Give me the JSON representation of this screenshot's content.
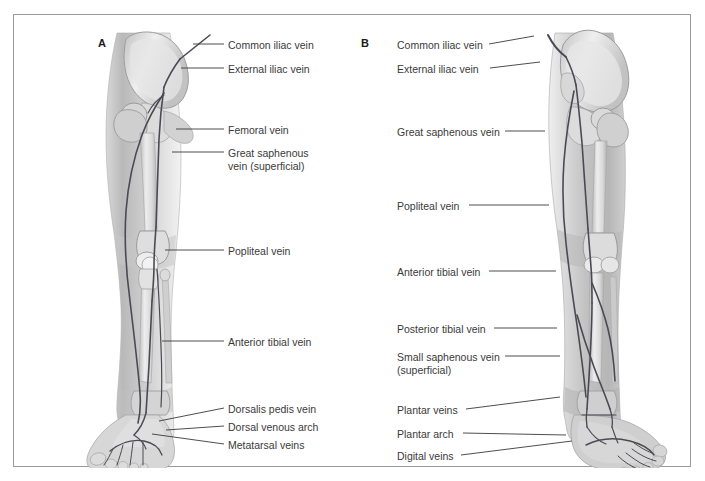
{
  "figure": {
    "background_color": "#ffffff",
    "frame_color": "#9a9a9a",
    "text_color": "#3a3a3a",
    "vein_color": "#4a4a52",
    "panels": [
      {
        "letter": "A",
        "view": "anterior"
      },
      {
        "letter": "B",
        "view": "posterior"
      }
    ]
  },
  "panel_a": {
    "letter": "A",
    "labels": [
      {
        "id": "common-iliac-vein",
        "text": "Common iliac vein",
        "x": 228,
        "y": 39,
        "leader": {
          "x1": 224,
          "y1": 44,
          "x2": 193,
          "y2": 44
        }
      },
      {
        "id": "external-iliac-vein",
        "text": "External iliac vein",
        "x": 228,
        "y": 63,
        "leader": {
          "x1": 224,
          "y1": 68,
          "x2": 181,
          "y2": 68
        }
      },
      {
        "id": "femoral-vein",
        "text": "Femoral vein",
        "x": 228,
        "y": 124,
        "leader": {
          "x1": 224,
          "y1": 129,
          "x2": 176,
          "y2": 129
        }
      },
      {
        "id": "great-saphenous-vein",
        "text": "Great saphenous\nvein (superficial)",
        "x": 228,
        "y": 147,
        "leader": {
          "x1": 224,
          "y1": 152,
          "x2": 172,
          "y2": 152
        }
      },
      {
        "id": "popliteal-vein",
        "text": "Popliteal vein",
        "x": 228,
        "y": 245,
        "leader": {
          "x1": 224,
          "y1": 250,
          "x2": 165,
          "y2": 250
        }
      },
      {
        "id": "anterior-tibial-vein",
        "text": "Anterior tibial vein",
        "x": 228,
        "y": 336,
        "leader": {
          "x1": 224,
          "y1": 341,
          "x2": 162,
          "y2": 341
        }
      },
      {
        "id": "dorsalis-pedis-vein",
        "text": "Dorsalis pedis vein",
        "x": 228,
        "y": 403,
        "leader": {
          "x1": 224,
          "y1": 408,
          "x2": 159,
          "y2": 421
        }
      },
      {
        "id": "dorsal-venous-arch",
        "text": "Dorsal venous arch",
        "x": 228,
        "y": 421,
        "leader": {
          "x1": 224,
          "y1": 426,
          "x2": 166,
          "y2": 430
        }
      },
      {
        "id": "metatarsal-veins",
        "text": "Metatarsal veins",
        "x": 228,
        "y": 439,
        "leader": {
          "x1": 224,
          "y1": 444,
          "x2": 152,
          "y2": 434
        }
      }
    ]
  },
  "panel_b": {
    "letter": "B",
    "labels": [
      {
        "id": "common-iliac-vein",
        "text": "Common iliac vein",
        "x": 397,
        "y": 39,
        "leader": {
          "x1": 489,
          "y1": 44,
          "x2": 534,
          "y2": 36
        }
      },
      {
        "id": "external-iliac-vein",
        "text": "External iliac vein",
        "x": 397,
        "y": 63,
        "leader": {
          "x1": 490,
          "y1": 68,
          "x2": 540,
          "y2": 62
        }
      },
      {
        "id": "great-saphenous-vein",
        "text": "Great saphenous vein",
        "x": 397,
        "y": 126,
        "leader": {
          "x1": 505,
          "y1": 131,
          "x2": 545,
          "y2": 131
        }
      },
      {
        "id": "popliteal-vein",
        "text": "Popliteal vein",
        "x": 397,
        "y": 200,
        "leader": {
          "x1": 469,
          "y1": 205,
          "x2": 549,
          "y2": 205
        }
      },
      {
        "id": "anterior-tibial-vein",
        "text": "Anterior tibial vein",
        "x": 397,
        "y": 266,
        "leader": {
          "x1": 489,
          "y1": 271,
          "x2": 556,
          "y2": 271
        }
      },
      {
        "id": "posterior-tibial-vein",
        "text": "Posterior tibial vein",
        "x": 397,
        "y": 323,
        "leader": {
          "x1": 494,
          "y1": 328,
          "x2": 557,
          "y2": 328
        }
      },
      {
        "id": "small-saphenous-vein",
        "text": "Small saphenous vein\n(superficial)",
        "x": 397,
        "y": 351,
        "leader": {
          "x1": 505,
          "y1": 356,
          "x2": 560,
          "y2": 356
        }
      },
      {
        "id": "plantar-veins",
        "text": "Plantar veins",
        "x": 397,
        "y": 404,
        "leader": {
          "x1": 466,
          "y1": 409,
          "x2": 560,
          "y2": 397
        }
      },
      {
        "id": "plantar-arch",
        "text": "Plantar arch",
        "x": 397,
        "y": 428,
        "leader": {
          "x1": 463,
          "y1": 433,
          "x2": 566,
          "y2": 435
        }
      },
      {
        "id": "digital-veins",
        "text": "Digital veins",
        "x": 397,
        "y": 450,
        "leader": {
          "x1": 461,
          "y1": 455,
          "x2": 572,
          "y2": 441
        }
      }
    ]
  }
}
